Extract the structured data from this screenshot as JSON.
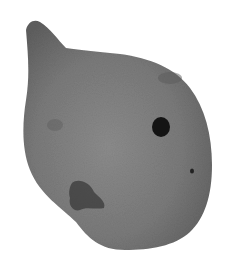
{
  "image": {
    "subject": "stone artifact with perforation",
    "colors": {
      "background": "#ffffff",
      "stone_light": "#8a8a8a",
      "stone_mid": "#787878",
      "stone_dark": "#5e5e5e",
      "hole": "#141414",
      "stain": "#3a3a3a"
    }
  }
}
